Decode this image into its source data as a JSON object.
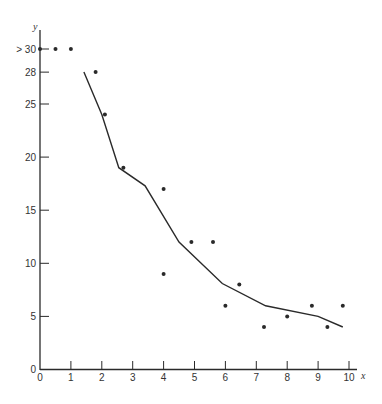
{
  "chart_data": {
    "type": "scatter",
    "title": "",
    "xlabel": "x",
    "ylabel": "y",
    "xlim": [
      0,
      10
    ],
    "ylim": [
      0,
      30
    ],
    "grid": false,
    "legend": null,
    "x_ticks": [
      "0",
      "1",
      "2",
      "3",
      "4",
      "5",
      "6",
      "7",
      "8",
      "9",
      "10"
    ],
    "y_ticks": [
      {
        "value": 0,
        "label": "0"
      },
      {
        "value": 5,
        "label": "5"
      },
      {
        "value": 10,
        "label": "10"
      },
      {
        "value": 15,
        "label": "15"
      },
      {
        "value": 20,
        "label": "20"
      },
      {
        "value": 25,
        "label": "25"
      },
      {
        "value": 28,
        "label": "28"
      },
      {
        "value": 30,
        "label": "> 30"
      }
    ],
    "series": [
      {
        "name": "observations",
        "kind": "scatter",
        "points": [
          {
            "x": 0,
            "y": 30,
            "note": "> 30"
          },
          {
            "x": 0.5,
            "y": 30,
            "note": "> 30"
          },
          {
            "x": 1.0,
            "y": 30,
            "note": "> 30"
          },
          {
            "x": 1.8,
            "y": 28
          },
          {
            "x": 2.1,
            "y": 24
          },
          {
            "x": 2.7,
            "y": 19
          },
          {
            "x": 4.0,
            "y": 17
          },
          {
            "x": 4.0,
            "y": 9
          },
          {
            "x": 4.9,
            "y": 12
          },
          {
            "x": 5.6,
            "y": 12
          },
          {
            "x": 6.0,
            "y": 6
          },
          {
            "x": 6.45,
            "y": 8
          },
          {
            "x": 7.25,
            "y": 4
          },
          {
            "x": 8.0,
            "y": 5
          },
          {
            "x": 8.8,
            "y": 6
          },
          {
            "x": 9.3,
            "y": 4
          },
          {
            "x": 9.8,
            "y": 6
          }
        ]
      },
      {
        "name": "fitted curve",
        "kind": "line",
        "points": [
          {
            "x": 1.42,
            "y": 28
          },
          {
            "x": 2.0,
            "y": 24
          },
          {
            "x": 2.55,
            "y": 19
          },
          {
            "x": 3.4,
            "y": 17.3
          },
          {
            "x": 4.5,
            "y": 12
          },
          {
            "x": 5.9,
            "y": 8.1
          },
          {
            "x": 7.3,
            "y": 6
          },
          {
            "x": 9.0,
            "y": 5
          },
          {
            "x": 9.8,
            "y": 4
          }
        ]
      }
    ]
  },
  "colors": {
    "ink": "#2a2a2a",
    "background": "#ffffff"
  }
}
